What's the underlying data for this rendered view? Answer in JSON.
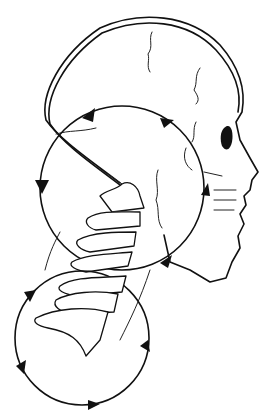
{
  "figure": {
    "background_color": "#ffffff",
    "line_color": "#111111",
    "elements": {
      "skull": "skull-outline",
      "upper_circle": "upper-rotation-circle",
      "lower_circle": "lower-rotation-circle",
      "vertebrae_count_upper": 4,
      "vertebrae_count_lower": 3,
      "arrow_count_upper": 4,
      "arrow_count_lower": 4
    }
  }
}
